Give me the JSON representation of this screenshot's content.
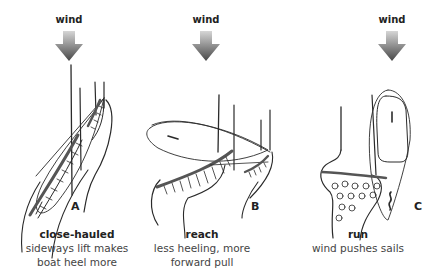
{
  "diagram": {
    "colors": {
      "line": "#2a2a2a",
      "arrow_top": "#d0d0d0",
      "arrow_bottom": "#4a4a4a",
      "background": "#ffffff"
    },
    "panels": [
      {
        "id": "A",
        "wind_label": "wind",
        "letter": "A",
        "title": "close-hauled",
        "description_line1": "sideways lift makes",
        "description_line2": "boat heel more",
        "icon": "wind-arrow-down-icon"
      },
      {
        "id": "B",
        "wind_label": "wind",
        "letter": "B",
        "title": "reach",
        "description_line1": "less heeling, more",
        "description_line2": "forward pull",
        "icon": "wind-arrow-down-icon"
      },
      {
        "id": "C",
        "wind_label": "wind",
        "letter": "C",
        "title": "run",
        "description_line1": "wind pushes sails",
        "description_line2": "",
        "icon": "wind-arrow-down-icon"
      }
    ]
  }
}
